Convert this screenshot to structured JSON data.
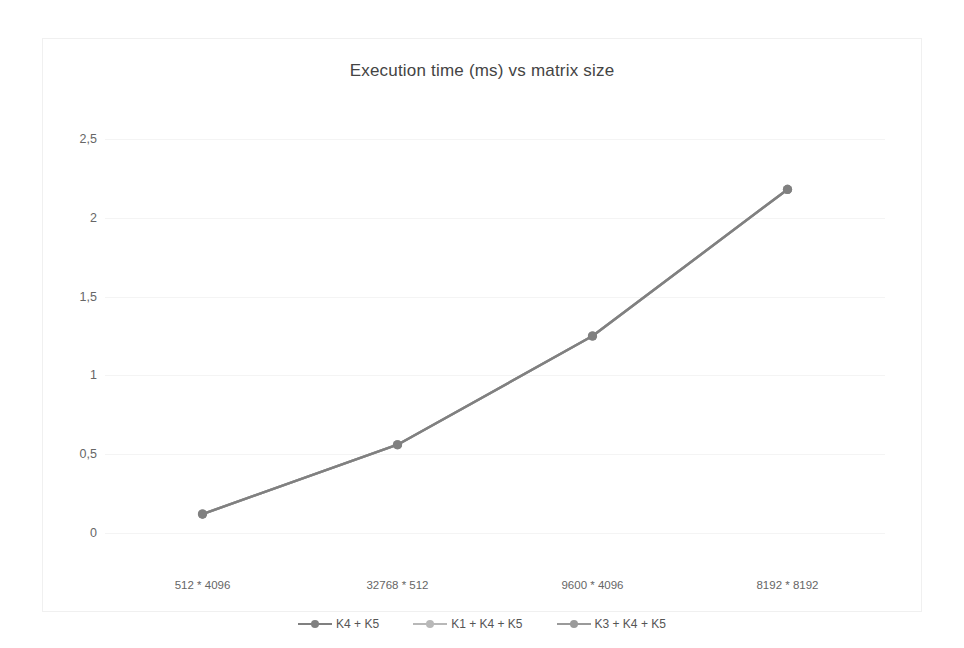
{
  "chart_data": {
    "type": "line",
    "title": "Execution time (ms) vs matrix size",
    "xlabel": "",
    "ylabel": "",
    "categories": [
      "512 * 4096",
      "32768 * 512",
      "9600 * 4096",
      "8192 * 8192"
    ],
    "ylim": [
      0,
      2.5
    ],
    "yticks": [
      "0",
      "0,5",
      "1",
      "1,5",
      "2",
      "2,5"
    ],
    "ytick_values": [
      0,
      0.5,
      1,
      1.5,
      2,
      2.5
    ],
    "grid": true,
    "legend_position": "bottom",
    "series": [
      {
        "name": "K4 + K5",
        "values": [
          0.12,
          0.56,
          1.25,
          2.18
        ],
        "color": "#808080"
      },
      {
        "name": "K1 + K4 + K5",
        "values": [
          0.12,
          0.56,
          1.25,
          2.18
        ],
        "color": "#b8b8b8"
      },
      {
        "name": "K3 + K4 + K5",
        "values": [
          0.12,
          0.56,
          1.25,
          2.18
        ],
        "color": "#9a9a9a"
      }
    ]
  },
  "colors": {
    "grid": "#f4f4f4",
    "text": "#666666",
    "title": "#444444",
    "frame": "#f0f0f0"
  }
}
